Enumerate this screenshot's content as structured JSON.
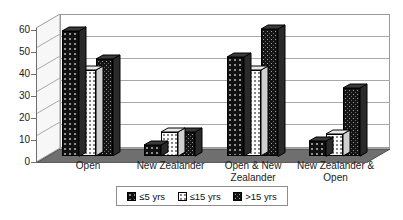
{
  "chart_data": {
    "type": "bar",
    "title": "",
    "subtitle": "",
    "xlabel": "",
    "ylabel": "",
    "ylim": [
      0,
      60
    ],
    "yticks": [
      0,
      10,
      20,
      30,
      40,
      50,
      60
    ],
    "grid": true,
    "legend_position": "bottom",
    "style": "3d-clustered-column",
    "categories": [
      "Open",
      "New Zealander",
      "Open & New Zealander",
      "New Zealander & Open"
    ],
    "series": [
      {
        "name": "≤5 yrs",
        "values": [
          57,
          5,
          45,
          7
        ],
        "fill": "solid-black-dotted",
        "color": "#111111"
      },
      {
        "name": "≤15 yrs",
        "values": [
          39,
          11,
          39,
          10
        ],
        "fill": "white-dotted",
        "color": "#fbfbfb"
      },
      {
        "name": ">15 yrs",
        "values": [
          44,
          11,
          58,
          31
        ],
        "fill": "dark-checkered",
        "color": "#141414"
      }
    ]
  },
  "axis": {
    "y_tick_labels": [
      "60",
      "50",
      "40",
      "30",
      "20",
      "10",
      "0"
    ]
  },
  "legend": {
    "items": [
      {
        "label": "≤5 yrs"
      },
      {
        "label": "≤15 yrs"
      },
      {
        "label": ">15 yrs"
      }
    ]
  },
  "colors": {
    "plot_border": "#9a9a9a",
    "gridline": "#a8a8a8",
    "axis_line": "#6e6e6e",
    "floor": "#6f6f6f",
    "sidewall": "#f2f2f2",
    "text": "#1a1a1a",
    "background": "#ffffff"
  }
}
